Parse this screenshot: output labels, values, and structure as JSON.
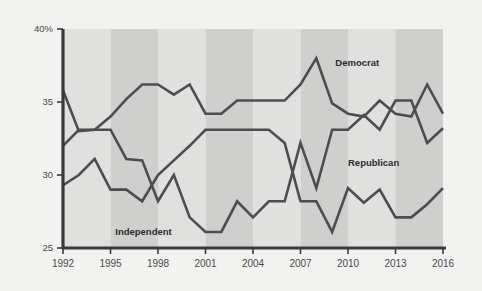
{
  "chart_data": {
    "type": "line",
    "title": "",
    "subtitle": "",
    "xlabel": "",
    "ylabel": "",
    "xlim": [
      1992,
      2016
    ],
    "ylim": [
      25,
      40
    ],
    "grid": false,
    "legend_position": "inline-annotations",
    "y_ticks": [
      "40%",
      "35",
      "30",
      "25"
    ],
    "y_tick_values": [
      40,
      35,
      30,
      25
    ],
    "x_ticks": [
      "1992",
      "1995",
      "1998",
      "2001",
      "2004",
      "2007",
      "2010",
      "2013",
      "2016"
    ],
    "x_tick_values": [
      1992,
      1995,
      1998,
      2001,
      2004,
      2007,
      2010,
      2013,
      2016
    ],
    "x": [
      1992,
      1993,
      1994,
      1995,
      1996,
      1997,
      1998,
      1999,
      2000,
      2001,
      2002,
      2003,
      2004,
      2005,
      2006,
      2007,
      2008,
      2009,
      2010,
      2011,
      2012,
      2013,
      2014,
      2015,
      2016
    ],
    "series": [
      {
        "name": "Democrat",
        "color": "#4d4d4d",
        "values": [
          35.8,
          33.0,
          33.1,
          34.0,
          35.2,
          36.2,
          36.2,
          35.5,
          36.2,
          34.2,
          34.2,
          35.1,
          35.1,
          35.1,
          35.1,
          36.2,
          38.0,
          34.9,
          34.2,
          34.0,
          35.1,
          34.2,
          34.0,
          36.2,
          34.2
        ]
      },
      {
        "name": "Republican",
        "color": "#4d4d4d",
        "values": [
          29.3,
          30.0,
          31.1,
          29.0,
          29.0,
          28.2,
          30.0,
          31.0,
          32.0,
          33.1,
          33.1,
          33.1,
          33.1,
          33.1,
          32.2,
          28.2,
          28.2,
          26.1,
          29.1,
          28.1,
          29.0,
          27.1,
          27.1,
          28.0,
          29.1
        ]
      },
      {
        "name": "Independent",
        "color": "#4d4d4d",
        "values": [
          32.0,
          33.1,
          33.1,
          33.1,
          31.1,
          31.0,
          28.2,
          30.0,
          27.1,
          26.1,
          26.1,
          28.2,
          27.1,
          28.2,
          28.2,
          32.2,
          29.1,
          33.1,
          33.1,
          34.1,
          33.1,
          35.1,
          35.1,
          32.2,
          33.2
        ]
      }
    ],
    "annotations": [
      {
        "label": "Democrat",
        "x": 2009.2,
        "y": 37.5
      },
      {
        "label": "Republican",
        "x": 2010.0,
        "y": 30.6
      },
      {
        "label": "Independent",
        "x": 1995.3,
        "y": 25.9
      }
    ],
    "background_bands": {
      "color_light": "#e0e0de",
      "color_dark": "#cfcfcd",
      "band_width_years": 3
    },
    "axis_color": "#3a3a3a",
    "page_background": "#f2f2f0"
  }
}
